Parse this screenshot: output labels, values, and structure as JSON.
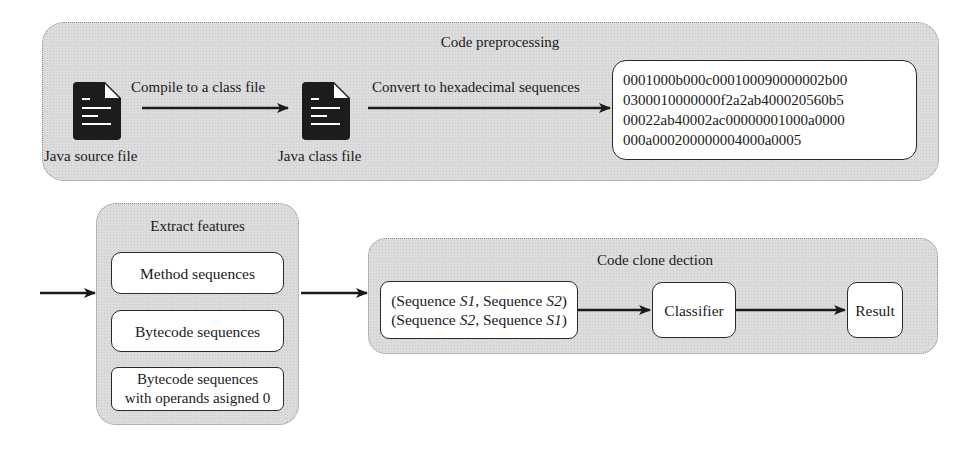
{
  "preprocessing": {
    "title": "Code preprocessing",
    "source_file_label": "Java source file",
    "class_file_label": "Java class file",
    "compile_arrow_label": "Compile to a class file",
    "convert_arrow_label": "Convert to hexadecimal sequences",
    "hex_lines": [
      "0001000b000c000100090000002b00",
      "0300010000000f2a2ab400020560b5",
      "00022ab40002ac00000001000a0000",
      "000a000200000004000a0005"
    ],
    "icons": [
      "document-icon",
      "document-icon"
    ]
  },
  "extract_features": {
    "title": "Extract features",
    "items": [
      {
        "label": "Method sequences"
      },
      {
        "label": "Bytecode sequences"
      },
      {
        "label_line1": "Bytecode sequences",
        "label_line2": "with operands asigned 0"
      }
    ]
  },
  "clone_detection": {
    "title": "Code clone dection",
    "pairs": {
      "line1": {
        "open": "(Sequence ",
        "s_a": "S1",
        "mid": ", Sequence ",
        "s_b": "S2",
        "close": ")"
      },
      "line2": {
        "open": "(Sequence ",
        "s_a": "S2",
        "mid": ", Sequence ",
        "s_b": "S1",
        "close": ")"
      }
    },
    "classifier_label": "Classifier",
    "result_label": "Result"
  },
  "colors": {
    "group_fill": "#dcdcdc",
    "box_fill": "#ffffff",
    "stroke": "#1a1a1a"
  }
}
